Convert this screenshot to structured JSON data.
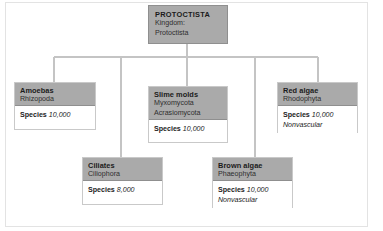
{
  "diagram": {
    "type": "hierarchy-tree",
    "colors": {
      "header_fill": "#aaaaaa",
      "header_border": "#8f8f8f",
      "box_border": "#c9c9c9",
      "connector": "#c4c4c4",
      "frame": "#e3e3e3",
      "background": "#ffffff",
      "text": "#1b1b1b"
    },
    "root": {
      "id": "protoctista",
      "title": "PROTOCTISTA",
      "sub_lines": [
        "Kingdom:",
        "Protoctista"
      ]
    },
    "children": [
      {
        "id": "amoebas",
        "title": "Amoebas",
        "sub_lines": [
          "Rhizopoda"
        ],
        "stat_label": "Species",
        "stat_value": "10,000",
        "note": ""
      },
      {
        "id": "ciliates",
        "title": "Ciliates",
        "sub_lines": [
          "Ciliophora"
        ],
        "stat_label": "Species",
        "stat_value": "8,000",
        "note": ""
      },
      {
        "id": "slime-molds",
        "title": "Slime molds",
        "sub_lines": [
          "Myxomycota",
          "Acrasiomycota"
        ],
        "stat_label": "Species",
        "stat_value": "10,000",
        "note": ""
      },
      {
        "id": "brown-algae",
        "title": "Brown algae",
        "sub_lines": [
          "Phaeophyta"
        ],
        "stat_label": "Species",
        "stat_value": "10,000",
        "note": "Nonvascular"
      },
      {
        "id": "red-algae",
        "title": "Red algae",
        "sub_lines": [
          "Rhodophyta"
        ],
        "stat_label": "Species",
        "stat_value": "10,000",
        "note": "Nonvascular"
      }
    ]
  }
}
